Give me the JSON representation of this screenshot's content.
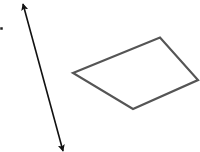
{
  "canvas": {
    "width": 200,
    "height": 152,
    "background": "#ffffff"
  },
  "dot": {
    "x": 1.5,
    "y": 28.5,
    "size": 2.5,
    "color": "#222222"
  },
  "arrow": {
    "start": {
      "x": 23,
      "y": 4
    },
    "end": {
      "x": 63,
      "y": 151
    },
    "color": "#111111",
    "width": 1.6,
    "heads": "both"
  },
  "quadrilateral": {
    "points": [
      {
        "x": 73,
        "y": 73
      },
      {
        "x": 160,
        "y": 37.5
      },
      {
        "x": 198,
        "y": 80
      },
      {
        "x": 133,
        "y": 109
      }
    ],
    "stroke": "#555555",
    "stroke_width": 2.2,
    "fill": "none"
  }
}
